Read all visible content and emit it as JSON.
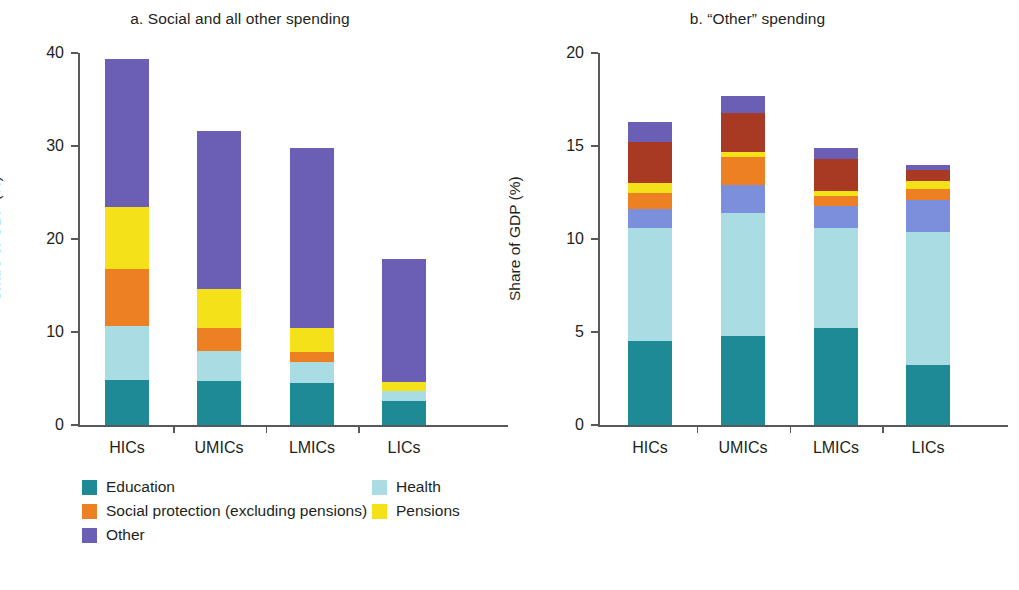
{
  "chart_data": [
    {
      "type": "bar",
      "panel_id": "a",
      "title": "a. Social and all other spending",
      "xlabel": "",
      "ylabel": "Share of GDP (%)",
      "ylim": [
        0,
        40
      ],
      "yticks": [
        0,
        10,
        20,
        30,
        40
      ],
      "ytick_labels": [
        "0",
        "10",
        "20",
        "30",
        "40"
      ],
      "grid": false,
      "stacked": true,
      "legend_position": "below",
      "categories": [
        "HICs",
        "UMICs",
        "LMICs",
        "LICs"
      ],
      "series": [
        {
          "name": "Education",
          "color": "#1d8a96",
          "values": [
            4.8,
            4.7,
            4.5,
            2.6
          ]
        },
        {
          "name": "Health",
          "color": "#a9dce3",
          "values": [
            5.8,
            3.3,
            2.3,
            1.1
          ]
        },
        {
          "name": "Social protection (excluding pensions)",
          "color": "#ee8024",
          "values": [
            6.2,
            2.4,
            1.1,
            0.0
          ]
        },
        {
          "name": "Pensions",
          "color": "#f5e11a",
          "values": [
            6.6,
            4.2,
            2.5,
            0.9
          ]
        },
        {
          "name": "Other",
          "color": "#6a5fb4",
          "values": [
            16.0,
            17.0,
            19.4,
            13.3
          ]
        }
      ],
      "totals": [
        39.4,
        31.6,
        29.8,
        17.9
      ]
    },
    {
      "type": "bar",
      "panel_id": "b",
      "title": "b. “Other” spending",
      "xlabel": "",
      "ylabel": "Share of GDP (%)",
      "ylim": [
        0,
        20
      ],
      "yticks": [
        0,
        5,
        10,
        15,
        20
      ],
      "ytick_labels": [
        "0",
        "5",
        "10",
        "15",
        "20"
      ],
      "grid": false,
      "stacked": true,
      "legend_position": "below",
      "categories": [
        "HICs",
        "UMICs",
        "LMICs",
        "LICs"
      ],
      "series": [
        {
          "name": "Economic affairs",
          "color": "#1d8a96",
          "values": [
            4.5,
            4.8,
            5.2,
            3.2
          ]
        },
        {
          "name": "General public services",
          "color": "#a9dce3",
          "values": [
            6.1,
            6.6,
            5.4,
            7.2
          ]
        },
        {
          "name": "Defense",
          "color": "#7b8fdc",
          "values": [
            1.0,
            1.5,
            1.2,
            1.7
          ]
        },
        {
          "name": "Housing",
          "color": "#ee8024",
          "values": [
            0.9,
            1.5,
            0.5,
            0.6
          ]
        },
        {
          "name": "Environment",
          "color": "#f5e11a",
          "values": [
            0.5,
            0.3,
            0.3,
            0.4
          ]
        },
        {
          "name": "Public order",
          "color": "#a83a24",
          "values": [
            2.2,
            2.1,
            1.7,
            0.6
          ]
        },
        {
          "name": "Recreation",
          "color": "#6a5fb4",
          "values": [
            1.1,
            0.9,
            0.6,
            0.3
          ]
        }
      ],
      "totals": [
        16.6,
        17.7,
        14.9,
        14.0
      ]
    }
  ],
  "panels": [
    {
      "title": "a. Social and all other spending",
      "ylabel": "Share of GDP (%)",
      "ytick_labels": [
        "0",
        "10",
        "20",
        "30",
        "40"
      ],
      "xtick_labels": [
        "HICs",
        "UMICs",
        "LMICs",
        "LICs"
      ],
      "legend": [
        {
          "label": "Education",
          "color": "#1d8a96"
        },
        {
          "label": "Health",
          "color": "#a9dce3"
        },
        {
          "label": "Social protection (excluding pensions)",
          "color": "#ee8024"
        },
        {
          "label": "Pensions",
          "color": "#f5e11a"
        },
        {
          "label": "Other",
          "color": "#6a5fb4"
        }
      ]
    },
    {
      "title": "b. “Other” spending",
      "ylabel": "Share of GDP (%)",
      "ytick_labels": [
        "0",
        "5",
        "10",
        "15",
        "20"
      ],
      "xtick_labels": [
        "HICs",
        "UMICs",
        "LMICs",
        "LICs"
      ],
      "legend": [
        {
          "label": "Economic affairs",
          "color": "#1d8a96"
        },
        {
          "label": "General public services",
          "color": "#a9dce3"
        },
        {
          "label": "Defense",
          "color": "#7b8fdc"
        },
        {
          "label": "Housing",
          "color": "#ee8024"
        },
        {
          "label": "Environment",
          "color": "#f5e11a"
        },
        {
          "label": "Public order",
          "color": "#a83a24"
        },
        {
          "label": "Recreation",
          "color": "#6a5fb4"
        }
      ]
    }
  ]
}
